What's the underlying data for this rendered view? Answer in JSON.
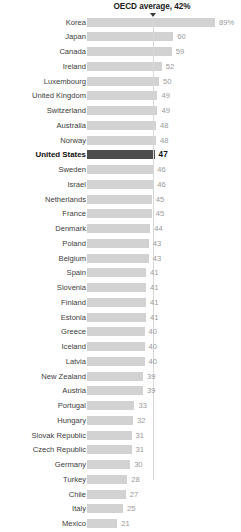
{
  "annotation": {
    "text": "OECD average, 42%",
    "value": 42,
    "arrow_icon": "down-triangle-icon"
  },
  "colors": {
    "bar": "#d2d2d2",
    "bar_highlight": "#4d4d4d",
    "gridline": "#d8d8d8",
    "value_text": "#9a9a9a",
    "label_text": "#3c3c3c",
    "highlight_text": "#111111"
  },
  "chart_data": {
    "type": "bar",
    "orientation": "horizontal",
    "title": "",
    "subtitle": "",
    "xlabel": "",
    "ylabel": "",
    "xlim": [
      0,
      89
    ],
    "grid": false,
    "legend": "none",
    "annotations": [
      {
        "label": "OECD average, 42%",
        "value": 42,
        "type": "reference-line"
      }
    ],
    "highlight": "United States",
    "categories": [
      "Korea",
      "Japan",
      "Canada",
      "Ireland",
      "Luxembourg",
      "United Kingdom",
      "Switzerland",
      "Australia",
      "Norway",
      "United States",
      "Sweden",
      "Israel",
      "Netherlands",
      "France",
      "Denmark",
      "Poland",
      "Belgium",
      "Spain",
      "Slovenia",
      "Finland",
      "Estonia",
      "Greece",
      "Iceland",
      "Latvia",
      "New Zealand",
      "Austria",
      "Portugal",
      "Hungary",
      "Slovak Republic",
      "Czech Republic",
      "Germany",
      "Turkey",
      "Chile",
      "Italy",
      "Mexico"
    ],
    "values": [
      89,
      60,
      59,
      52,
      50,
      49,
      49,
      48,
      48,
      47,
      46,
      46,
      45,
      45,
      44,
      43,
      43,
      41,
      41,
      41,
      41,
      40,
      40,
      40,
      39,
      39,
      33,
      32,
      31,
      31,
      30,
      28,
      27,
      25,
      21
    ],
    "value_labels": [
      "89%",
      "60",
      "59",
      "52",
      "50",
      "49",
      "49",
      "48",
      "48",
      "47",
      "46",
      "46",
      "45",
      "45",
      "44",
      "43",
      "43",
      "41",
      "41",
      "41",
      "41",
      "40",
      "40",
      "40",
      "39",
      "39",
      "33",
      "32",
      "31",
      "31",
      "30",
      "28",
      "27",
      "25",
      "21"
    ]
  }
}
